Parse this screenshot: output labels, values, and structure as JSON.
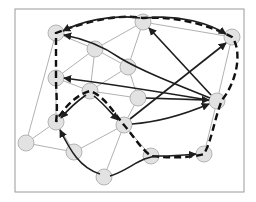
{
  "diagram": {
    "type": "graph-network",
    "colors": {
      "background": "#ffffff",
      "frame": "#9a9a9a",
      "node_fill": "#e2e2e2",
      "node_stroke": "#b4b4b4",
      "thin_edge": "#8f8f8f",
      "arrow": "#1e1e1e",
      "dashed_path": "#111111"
    },
    "frame": {
      "x": 15,
      "y": 9,
      "w": 229,
      "h": 183
    },
    "node_radius": 8,
    "nodes": [
      {
        "id": "A",
        "x": 56,
        "y": 33
      },
      {
        "id": "B",
        "x": 95,
        "y": 49
      },
      {
        "id": "C",
        "x": 143,
        "y": 22
      },
      {
        "id": "D",
        "x": 232,
        "y": 37
      },
      {
        "id": "E",
        "x": 56,
        "y": 78
      },
      {
        "id": "F",
        "x": 128,
        "y": 67
      },
      {
        "id": "G",
        "x": 90,
        "y": 91
      },
      {
        "id": "H",
        "x": 138,
        "y": 98
      },
      {
        "id": "I",
        "x": 217,
        "y": 101
      },
      {
        "id": "J",
        "x": 56,
        "y": 122
      },
      {
        "id": "K",
        "x": 26,
        "y": 143
      },
      {
        "id": "L",
        "x": 74,
        "y": 152
      },
      {
        "id": "M",
        "x": 124,
        "y": 125
      },
      {
        "id": "N",
        "x": 151,
        "y": 156
      },
      {
        "id": "O",
        "x": 204,
        "y": 154
      },
      {
        "id": "P",
        "x": 104,
        "y": 177
      }
    ],
    "thin_edges": [
      [
        "A",
        "B"
      ],
      [
        "A",
        "K"
      ],
      [
        "B",
        "C"
      ],
      [
        "B",
        "E"
      ],
      [
        "B",
        "F"
      ],
      [
        "B",
        "G"
      ],
      [
        "C",
        "F"
      ],
      [
        "C",
        "D"
      ],
      [
        "E",
        "G"
      ],
      [
        "F",
        "G"
      ],
      [
        "F",
        "H"
      ],
      [
        "G",
        "M"
      ],
      [
        "G",
        "H"
      ],
      [
        "H",
        "M"
      ],
      [
        "H",
        "I"
      ],
      [
        "J",
        "K"
      ],
      [
        "K",
        "L"
      ],
      [
        "L",
        "M"
      ],
      [
        "J",
        "L"
      ],
      [
        "M",
        "P"
      ],
      [
        "M",
        "N"
      ],
      [
        "D",
        "I"
      ],
      [
        "I",
        "O"
      ],
      [
        "C",
        "I"
      ],
      [
        "E",
        "J"
      ]
    ],
    "arrows": [
      {
        "from": "I",
        "to": "A",
        "curve": "s-curve via B"
      },
      {
        "from": "I",
        "to": "E",
        "curve": "slight"
      },
      {
        "from": "I",
        "to": "C",
        "curve": "straight"
      },
      {
        "from": "M",
        "to": "D",
        "curve": "straight"
      },
      {
        "from": "M",
        "to": "I",
        "curve": "slight"
      },
      {
        "from": "H",
        "to": "I",
        "curve": "straight"
      },
      {
        "from": "G",
        "to": "J",
        "curve": "arc"
      },
      {
        "from": "G",
        "to": "M",
        "curve": "arc"
      },
      {
        "from": "P",
        "to": "J",
        "curve": "s-curve"
      },
      {
        "from": "P",
        "to": "O",
        "curve": "s-curve via N"
      },
      {
        "from": "C",
        "to": "D",
        "curve": "arc top"
      }
    ],
    "dashed_tour": [
      "J",
      "E",
      "A",
      "C",
      "D",
      "I",
      "O",
      "N",
      "M",
      "G",
      "J"
    ]
  }
}
